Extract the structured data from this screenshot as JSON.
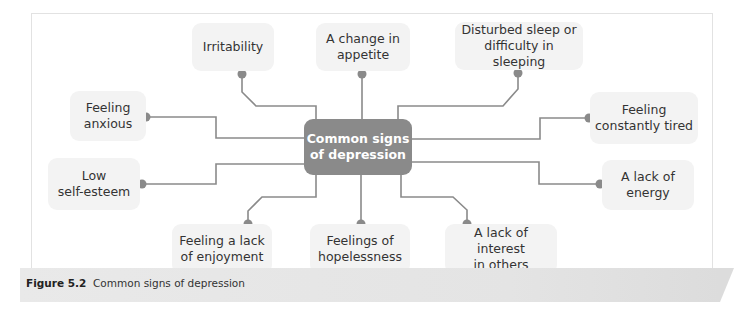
{
  "diagram": {
    "center": {
      "label": "Common signs of depression",
      "line1": "Common signs",
      "line2": "of depression",
      "color": "#8a8a8a"
    },
    "nodes": [
      {
        "id": "irritability",
        "line1": "Irritability",
        "line2": ""
      },
      {
        "id": "appetite",
        "line1": "A change in",
        "line2": "appetite"
      },
      {
        "id": "sleep",
        "line1": "Disturbed sleep or",
        "line2": "difficulty in sleeping"
      },
      {
        "id": "anxious",
        "line1": "Feeling",
        "line2": "anxious"
      },
      {
        "id": "tired",
        "line1": "Feeling",
        "line2": "constantly tired"
      },
      {
        "id": "self-esteem",
        "line1": "Low",
        "line2": "self-esteem"
      },
      {
        "id": "energy",
        "line1": "A lack of",
        "line2": "energy"
      },
      {
        "id": "enjoyment",
        "line1": "Feeling a lack",
        "line2": "of enjoyment"
      },
      {
        "id": "hopelessness",
        "line1": "Feelings of",
        "line2": "hopelessness"
      },
      {
        "id": "interest",
        "line1": "A lack of interest",
        "line2": "in others"
      }
    ],
    "node_bg": "#f3f3f3",
    "link_color": "#8a8a8a"
  },
  "caption": {
    "figure_label": "Figure 5.2",
    "text": "Common signs of depression"
  }
}
